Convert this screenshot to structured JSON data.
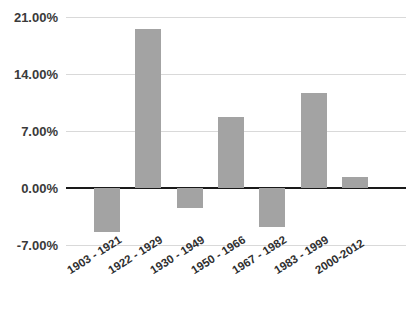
{
  "chart_data": {
    "type": "bar",
    "title": "",
    "title_clipped": true,
    "xlabel": "",
    "ylabel": "",
    "categories": [
      "1903 - 1921",
      "1922 - 1929",
      "1930 - 1949",
      "1950 - 1966",
      "1967 - 1982",
      "1983 - 1999",
      "2000-2012"
    ],
    "values": [
      -5.4,
      19.5,
      -2.5,
      8.7,
      -4.8,
      11.7,
      1.4
    ],
    "ylim": [
      -7,
      21
    ],
    "yticks": [
      21,
      14,
      7,
      0,
      -7
    ],
    "ytick_labels": [
      "21.00%",
      "14.00%",
      "7.00%",
      "0.00%",
      "-7.00%"
    ],
    "grid": true,
    "legend": "none",
    "bar_color": "#a3a3a3",
    "zero_axis_color": "#1a1a1a",
    "gridline_color": "#d9d9d9"
  },
  "axes": {
    "y": {
      "ticks": [
        {
          "label": "21.00%",
          "value": 21
        },
        {
          "label": "14.00%",
          "value": 14
        },
        {
          "label": "7.00%",
          "value": 7
        },
        {
          "label": "0.00%",
          "value": 0
        },
        {
          "label": "-7.00%",
          "value": -7
        }
      ]
    },
    "x": {
      "ticks": [
        {
          "label": "1903 - 1921"
        },
        {
          "label": "1922 - 1929"
        },
        {
          "label": "1930 - 1949"
        },
        {
          "label": "1950 - 1966"
        },
        {
          "label": "1967 - 1982"
        },
        {
          "label": "1983 - 1999"
        },
        {
          "label": "2000-2012"
        }
      ]
    }
  }
}
